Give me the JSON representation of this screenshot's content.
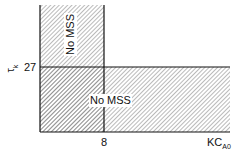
{
  "diagram": {
    "y_axis_label": "τ",
    "y_axis_label_sub": "k",
    "x_axis_label": "KC",
    "x_axis_label_sub": "A0",
    "y_tick": "27",
    "x_tick": "8",
    "regions": [
      {
        "label": "No MSS",
        "orientation": "vertical"
      },
      {
        "label": "No MSS",
        "orientation": "horizontal"
      }
    ],
    "colors": {
      "line": "#111111",
      "hatch": "#555555",
      "background": "#ffffff"
    }
  }
}
